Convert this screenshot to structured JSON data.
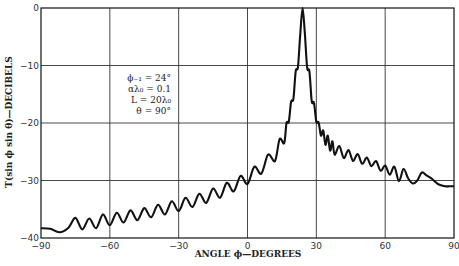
{
  "chart_data": {
    "type": "line",
    "title": "",
    "xlabel": "ANGLE ϕ—DEGREES",
    "ylabel": "T(sin ϕ sin θ)—DECIBELS",
    "xlim": [
      -90,
      90
    ],
    "ylim": [
      -40,
      0
    ],
    "xticks": [
      -90,
      -60,
      -30,
      0,
      30,
      60,
      90
    ],
    "xtick_labels": [
      "−90",
      "−60",
      "−30",
      "0",
      "30",
      "60",
      "90"
    ],
    "yticks": [
      0,
      -10,
      -20,
      -30,
      -40
    ],
    "ytick_labels": [
      "0",
      "−10",
      "−20",
      "−30",
      "−40"
    ],
    "grid": true,
    "legend": "none",
    "annotations": [
      "ϕ₋₁ = 24°",
      "αλ₀ = 0.1",
      "L = 20λ₀",
      "θ = 90°"
    ],
    "series": [
      {
        "name": "radiation pattern",
        "x": [
          -90,
          -86,
          -82,
          -78,
          -75,
          -72,
          -69,
          -66,
          -63,
          -60,
          -57,
          -54,
          -51,
          -48,
          -45,
          -42,
          -39,
          -36,
          -33,
          -30,
          -27,
          -24,
          -21,
          -18,
          -15,
          -12,
          -9,
          -6,
          -3,
          0,
          3,
          6,
          9,
          12,
          14,
          16,
          17,
          18,
          19,
          20,
          21,
          22,
          23,
          24,
          25,
          26,
          27,
          28,
          29,
          30,
          31,
          32,
          33,
          34,
          35,
          36,
          37,
          38,
          40,
          42,
          44,
          46,
          48,
          50,
          52,
          54,
          56,
          58,
          60,
          62,
          64,
          66,
          68,
          70,
          72,
          74,
          76,
          78,
          80,
          83,
          86,
          88,
          90
        ],
        "y": [
          -38.3,
          -38.4,
          -39.0,
          -38.2,
          -36.5,
          -38.5,
          -36.6,
          -38.3,
          -35.9,
          -37.8,
          -35.6,
          -37.3,
          -35.2,
          -36.9,
          -34.8,
          -36.4,
          -34.2,
          -35.9,
          -33.6,
          -35.3,
          -33.0,
          -34.6,
          -32.3,
          -33.9,
          -31.4,
          -33.0,
          -30.4,
          -31.9,
          -29.2,
          -30.6,
          -27.6,
          -28.8,
          -25.5,
          -26.6,
          -22.8,
          -23.5,
          -20.0,
          -19.8,
          -16.3,
          -15.8,
          -11.0,
          -10.2,
          -4.5,
          0.0,
          -4.5,
          -10.4,
          -11.0,
          -16.2,
          -16.5,
          -19.8,
          -19.9,
          -22.2,
          -21.3,
          -23.8,
          -22.2,
          -24.8,
          -23.2,
          -25.5,
          -24.0,
          -26.1,
          -24.7,
          -26.6,
          -25.4,
          -27.1,
          -26.0,
          -27.5,
          -26.6,
          -28.3,
          -27.4,
          -29.0,
          -27.6,
          -30.1,
          -28.0,
          -29.6,
          -30.5,
          -30.0,
          -28.6,
          -29.1,
          -29.6,
          -30.6,
          -31.0,
          -31.0,
          -31.0
        ]
      }
    ]
  }
}
